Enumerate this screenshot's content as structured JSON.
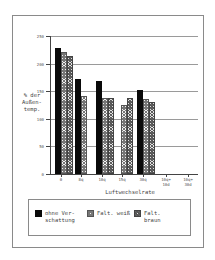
{
  "chart_data": {
    "type": "bar",
    "title": "",
    "xlabel": "Luftwechselrate",
    "ylabel": "% der\nAußen-\ntemp.",
    "ylim": [
      0,
      250
    ],
    "yticks": [
      0,
      50,
      100,
      150,
      200,
      250
    ],
    "grid": true,
    "legend_position": "bottom",
    "categories": [
      "0",
      "8q",
      "10q",
      "15q",
      "30q",
      "10q+\n10d",
      "10q+\n30d"
    ],
    "series": [
      {
        "name": "ohne Verschattung",
        "label": "ohne Ver-\nschattung",
        "color": "#0a0a0a",
        "values": [
          228,
          173,
          168,
          null,
          152,
          null,
          null
        ]
      },
      {
        "name": "Falt. weiß",
        "label": "Falt. weiß",
        "color": "#cccccc",
        "values": [
          221,
          141,
          138,
          125,
          136,
          null,
          null
        ]
      },
      {
        "name": "Falt. braun",
        "label": "Falt.\nbraun",
        "color": "#999999",
        "values": [
          214,
          null,
          138,
          138,
          131,
          null,
          null
        ]
      }
    ]
  },
  "legend": {
    "items": [
      {
        "label": "ohne Ver-\nschattung"
      },
      {
        "label": "Falt. weiß"
      },
      {
        "label": "Falt.\nbraun"
      }
    ]
  }
}
